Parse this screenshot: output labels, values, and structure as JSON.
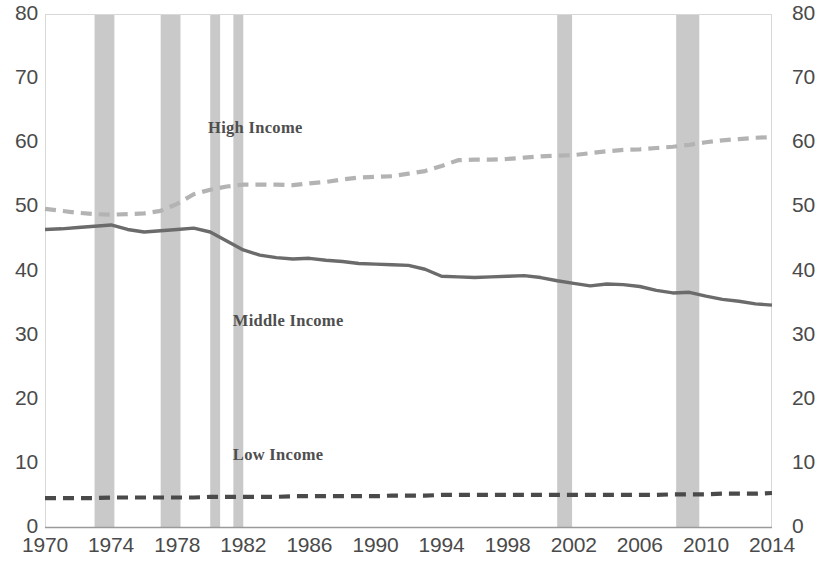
{
  "chart_data": {
    "type": "line",
    "title": "",
    "subtitle": "",
    "xlabel": "",
    "ylabel": "",
    "xlim": [
      1970,
      2014
    ],
    "ylim": [
      0,
      80
    ],
    "grid": false,
    "legend_position": "inline-annotations",
    "y_ticks": [
      0,
      10,
      20,
      30,
      40,
      50,
      60,
      70,
      80
    ],
    "y_ticks_right": [
      0,
      10,
      20,
      30,
      40,
      50,
      60,
      70,
      80
    ],
    "x_ticks": [
      1970,
      1974,
      1978,
      1982,
      1986,
      1990,
      1994,
      1998,
      2002,
      2006,
      2010,
      2014
    ],
    "x": [
      1970,
      1971,
      1972,
      1973,
      1974,
      1975,
      1976,
      1977,
      1978,
      1979,
      1980,
      1981,
      1982,
      1983,
      1984,
      1985,
      1986,
      1987,
      1988,
      1989,
      1990,
      1991,
      1992,
      1993,
      1994,
      1995,
      1996,
      1997,
      1998,
      1999,
      2000,
      2001,
      2002,
      2003,
      2004,
      2005,
      2006,
      2007,
      2008,
      2009,
      2010,
      2011,
      2012,
      2013,
      2014
    ],
    "series": [
      {
        "name": "High Income",
        "style": "dashed",
        "color": "#b3b3b3",
        "label_x": 1983.5,
        "label_y": 62.0,
        "values": [
          49.6,
          49.3,
          49.0,
          48.8,
          48.7,
          48.8,
          48.9,
          49.3,
          50.4,
          51.9,
          52.6,
          53.1,
          53.4,
          53.4,
          53.4,
          53.3,
          53.6,
          53.8,
          54.2,
          54.5,
          54.6,
          54.7,
          55.1,
          55.5,
          56.3,
          57.2,
          57.3,
          57.3,
          57.4,
          57.6,
          57.8,
          57.9,
          58.0,
          58.3,
          58.6,
          58.8,
          58.9,
          59.1,
          59.3,
          59.6,
          60.0,
          60.3,
          60.5,
          60.7,
          60.8
        ]
      },
      {
        "name": "Middle Income",
        "style": "solid",
        "color": "#6b6b6b",
        "label_x": 1985.0,
        "label_y": 32.0,
        "values": [
          46.4,
          46.5,
          46.7,
          46.9,
          47.1,
          46.4,
          46.0,
          46.2,
          46.4,
          46.6,
          46.0,
          44.6,
          43.2,
          42.4,
          42.0,
          41.8,
          41.9,
          41.6,
          41.4,
          41.1,
          41.0,
          40.9,
          40.8,
          40.2,
          39.1,
          39.0,
          38.9,
          39.0,
          39.1,
          39.2,
          38.9,
          38.4,
          38.0,
          37.6,
          37.9,
          37.8,
          37.5,
          36.9,
          36.5,
          36.6,
          36.0,
          35.5,
          35.2,
          34.8,
          34.6
        ]
      },
      {
        "name": "Low Income",
        "style": "dashed",
        "color": "#4a4a4a",
        "label_x": 1985.0,
        "label_y": 11.0,
        "values": [
          4.5,
          4.5,
          4.5,
          4.5,
          4.6,
          4.6,
          4.6,
          4.6,
          4.6,
          4.6,
          4.7,
          4.7,
          4.7,
          4.7,
          4.7,
          4.8,
          4.8,
          4.8,
          4.8,
          4.8,
          4.8,
          4.9,
          4.9,
          4.9,
          5.0,
          5.0,
          5.0,
          5.0,
          5.0,
          5.0,
          5.0,
          5.0,
          5.0,
          5.0,
          5.0,
          5.0,
          5.0,
          5.0,
          5.1,
          5.1,
          5.1,
          5.2,
          5.2,
          5.2,
          5.3
        ]
      }
    ],
    "recession_bands": [
      {
        "start": 1973.0,
        "end": 1974.2
      },
      {
        "start": 1977.0,
        "end": 1978.2
      },
      {
        "start": 1980.0,
        "end": 1980.6
      },
      {
        "start": 1981.4,
        "end": 1982.0
      },
      {
        "start": 2001.0,
        "end": 2001.9
      },
      {
        "start": 2008.2,
        "end": 2009.6
      }
    ],
    "band_color": "#c9c9c9"
  },
  "axes": {
    "left_ticks": [
      "80",
      "70",
      "60",
      "50",
      "40",
      "30",
      "20",
      "10",
      "0"
    ],
    "right_ticks": [
      "80",
      "70",
      "60",
      "50",
      "40",
      "30",
      "20",
      "10",
      "0"
    ],
    "x_ticks": [
      "1970",
      "1974",
      "1978",
      "1982",
      "1986",
      "1990",
      "1994",
      "1998",
      "2002",
      "2006",
      "2010",
      "2014"
    ]
  },
  "annotations": {
    "high": "High Income",
    "middle": "Middle Income",
    "low": "Low Income"
  }
}
